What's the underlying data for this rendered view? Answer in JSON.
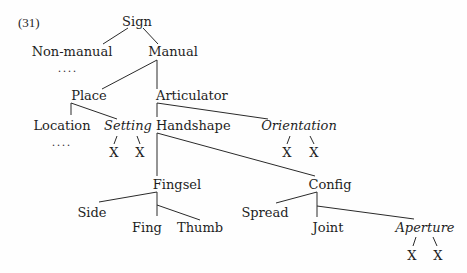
{
  "example_label": "(31)",
  "tree": {
    "root": "Sign",
    "nodes": {
      "sign": "Sign",
      "non_manual": "Non-manual",
      "manual": "Manual",
      "place": "Place",
      "articulator": "Articulator",
      "location": "Location",
      "setting": "Setting",
      "handshape": "Handshape",
      "orientation": "Orientation",
      "fingsel": "Fingsel",
      "config": "Config",
      "side": "Side",
      "fing": "Fing",
      "thumb": "Thumb",
      "spread": "Spread",
      "joint": "Joint",
      "aperture": "Aperture"
    },
    "ellipsis": "....",
    "terminal": "X",
    "italic_nodes": [
      "Setting",
      "Orientation",
      "Aperture"
    ],
    "edges": [
      [
        "Sign",
        "Non-manual"
      ],
      [
        "Sign",
        "Manual"
      ],
      [
        "Manual",
        "Place"
      ],
      [
        "Manual",
        "Articulator"
      ],
      [
        "Place",
        "Location"
      ],
      [
        "Place",
        "Setting"
      ],
      [
        "Articulator",
        "Handshape"
      ],
      [
        "Articulator",
        "Orientation"
      ],
      [
        "Handshape",
        "Fingsel"
      ],
      [
        "Handshape",
        "Config"
      ],
      [
        "Fingsel",
        "Side"
      ],
      [
        "Fingsel",
        "Fing"
      ],
      [
        "Fingsel",
        "Thumb"
      ],
      [
        "Config",
        "Spread"
      ],
      [
        "Config",
        "Joint"
      ],
      [
        "Config",
        "Aperture"
      ],
      [
        "Setting",
        "X"
      ],
      [
        "Setting",
        "X"
      ],
      [
        "Orientation",
        "X"
      ],
      [
        "Orientation",
        "X"
      ],
      [
        "Aperture",
        "X"
      ],
      [
        "Aperture",
        "X"
      ]
    ]
  }
}
